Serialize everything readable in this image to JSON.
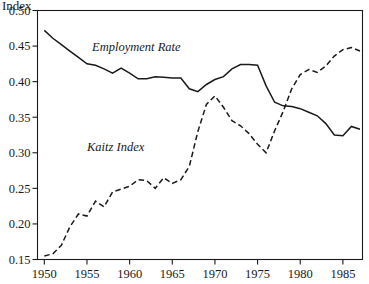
{
  "chart_data": {
    "type": "line",
    "title": "Index",
    "xlabel": "",
    "ylabel": "Index",
    "xlim": [
      1949.2,
      1987.3
    ],
    "ylim": [
      0.15,
      0.5
    ],
    "grid": false,
    "legend_position": "inline-annotations",
    "yticks": [
      "0.15",
      "0.20",
      "0.25",
      "0.30",
      "0.35",
      "0.40",
      "0.45",
      "0.50"
    ],
    "ytick_values": [
      0.15,
      0.2,
      0.25,
      0.3,
      0.35,
      0.4,
      0.45,
      0.5
    ],
    "xticks": [
      "1950",
      "1955",
      "1960",
      "1965",
      "1970",
      "1975",
      "1980",
      "1985"
    ],
    "xtick_values": [
      1950,
      1955,
      1960,
      1965,
      1970,
      1975,
      1980,
      1985
    ],
    "annotations": [
      {
        "text": "Employment Rate",
        "x": 1955.6,
        "y": 0.443
      },
      {
        "text": "Kaitz Index",
        "x": 1955.0,
        "y": 0.302
      }
    ],
    "series": [
      {
        "name": "Employment Rate",
        "style": "solid",
        "color": "#1a1a1a",
        "x": [
          1950,
          1951,
          1952,
          1953,
          1954,
          1955,
          1956,
          1957,
          1958,
          1959,
          1960,
          1961,
          1962,
          1963,
          1964,
          1965,
          1966,
          1967,
          1968,
          1969,
          1970,
          1971,
          1972,
          1973,
          1974,
          1975,
          1976,
          1977,
          1978,
          1979,
          1980,
          1981,
          1982,
          1983,
          1984,
          1985,
          1986,
          1987
        ],
        "values": [
          0.472,
          0.461,
          0.452,
          0.443,
          0.434,
          0.425,
          0.423,
          0.418,
          0.412,
          0.419,
          0.412,
          0.404,
          0.404,
          0.407,
          0.406,
          0.405,
          0.405,
          0.39,
          0.386,
          0.396,
          0.403,
          0.407,
          0.418,
          0.424,
          0.424,
          0.423,
          0.394,
          0.371,
          0.366,
          0.365,
          0.362,
          0.357,
          0.352,
          0.341,
          0.325,
          0.324,
          0.337,
          0.333
        ]
      },
      {
        "name": "Kaitz Index",
        "style": "dashed",
        "color": "#1a1a1a",
        "x": [
          1950,
          1951,
          1952,
          1953,
          1954,
          1955,
          1956,
          1957,
          1958,
          1959,
          1960,
          1961,
          1962,
          1963,
          1964,
          1965,
          1966,
          1967,
          1968,
          1969,
          1970,
          1971,
          1972,
          1973,
          1974,
          1975,
          1976,
          1977,
          1978,
          1979,
          1980,
          1981,
          1982,
          1983,
          1984,
          1985,
          1986,
          1987
        ],
        "values": [
          0.155,
          0.158,
          0.17,
          0.196,
          0.214,
          0.211,
          0.232,
          0.224,
          0.245,
          0.249,
          0.253,
          0.262,
          0.261,
          0.25,
          0.265,
          0.257,
          0.262,
          0.281,
          0.33,
          0.368,
          0.38,
          0.364,
          0.345,
          0.338,
          0.327,
          0.312,
          0.3,
          0.331,
          0.358,
          0.39,
          0.41,
          0.417,
          0.413,
          0.422,
          0.436,
          0.445,
          0.448,
          0.443
        ]
      }
    ]
  }
}
